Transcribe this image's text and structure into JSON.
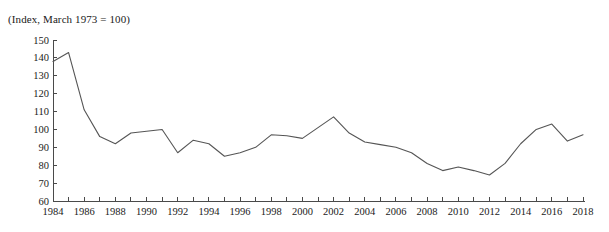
{
  "chart_data": {
    "type": "line",
    "title": "(Index, March 1973 = 100)",
    "xlabel": "",
    "ylabel": "",
    "xlim": [
      1984,
      2018
    ],
    "ylim": [
      60,
      150
    ],
    "y_ticks": [
      60,
      70,
      80,
      90,
      100,
      110,
      120,
      130,
      140,
      150
    ],
    "x_ticks": [
      1984,
      1985,
      1986,
      1987,
      1988,
      1989,
      1990,
      1991,
      1992,
      1993,
      1994,
      1995,
      1996,
      1997,
      1998,
      1999,
      2000,
      2001,
      2002,
      2003,
      2004,
      2005,
      2006,
      2007,
      2008,
      2009,
      2010,
      2011,
      2012,
      2013,
      2014,
      2015,
      2016,
      2017,
      2018
    ],
    "x_tick_labels": [
      "1984",
      "",
      "1986",
      "",
      "1988",
      "",
      "1990",
      "",
      "1992",
      "",
      "1994",
      "",
      "1996",
      "",
      "1998",
      "",
      "2000",
      "",
      "2002",
      "",
      "2004",
      "",
      "2006",
      "",
      "2008",
      "",
      "2010",
      "",
      "2012",
      "",
      "2014",
      "",
      "2016",
      "",
      "2018"
    ],
    "grid": false,
    "legend": null,
    "line_color": "#555555",
    "axis_color": "#4a4a4a",
    "background_color": "#ffffff",
    "x": [
      1984,
      1985,
      1986,
      1987,
      1988,
      1989,
      1990,
      1991,
      1992,
      1993,
      1994,
      1995,
      1996,
      1997,
      1998,
      1999,
      2000,
      2001,
      2002,
      2003,
      2004,
      2005,
      2006,
      2007,
      2008,
      2009,
      2010,
      2011,
      2012,
      2013,
      2014,
      2015,
      2016,
      2017,
      2018
    ],
    "values": [
      138.0,
      143.0,
      111.0,
      96.0,
      92.0,
      98.0,
      99.0,
      100.0,
      87.0,
      94.0,
      92.0,
      85.0,
      87.0,
      90.0,
      97.0,
      96.5,
      95.0,
      101.0,
      107.0,
      98.0,
      93.0,
      91.5,
      90.0,
      87.0,
      81.0,
      77.0,
      79.0,
      77.0,
      74.5,
      81.0,
      92.0,
      100.0,
      103.0,
      93.5,
      97.0
    ]
  }
}
